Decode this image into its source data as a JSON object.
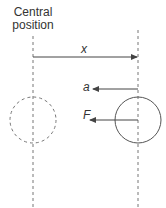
{
  "title": {
    "line1": "Central",
    "line2": "position"
  },
  "labels": {
    "x": "x",
    "a": "a",
    "F": "F"
  },
  "colors": {
    "stroke": "#555555",
    "dashed": "#777777"
  }
}
